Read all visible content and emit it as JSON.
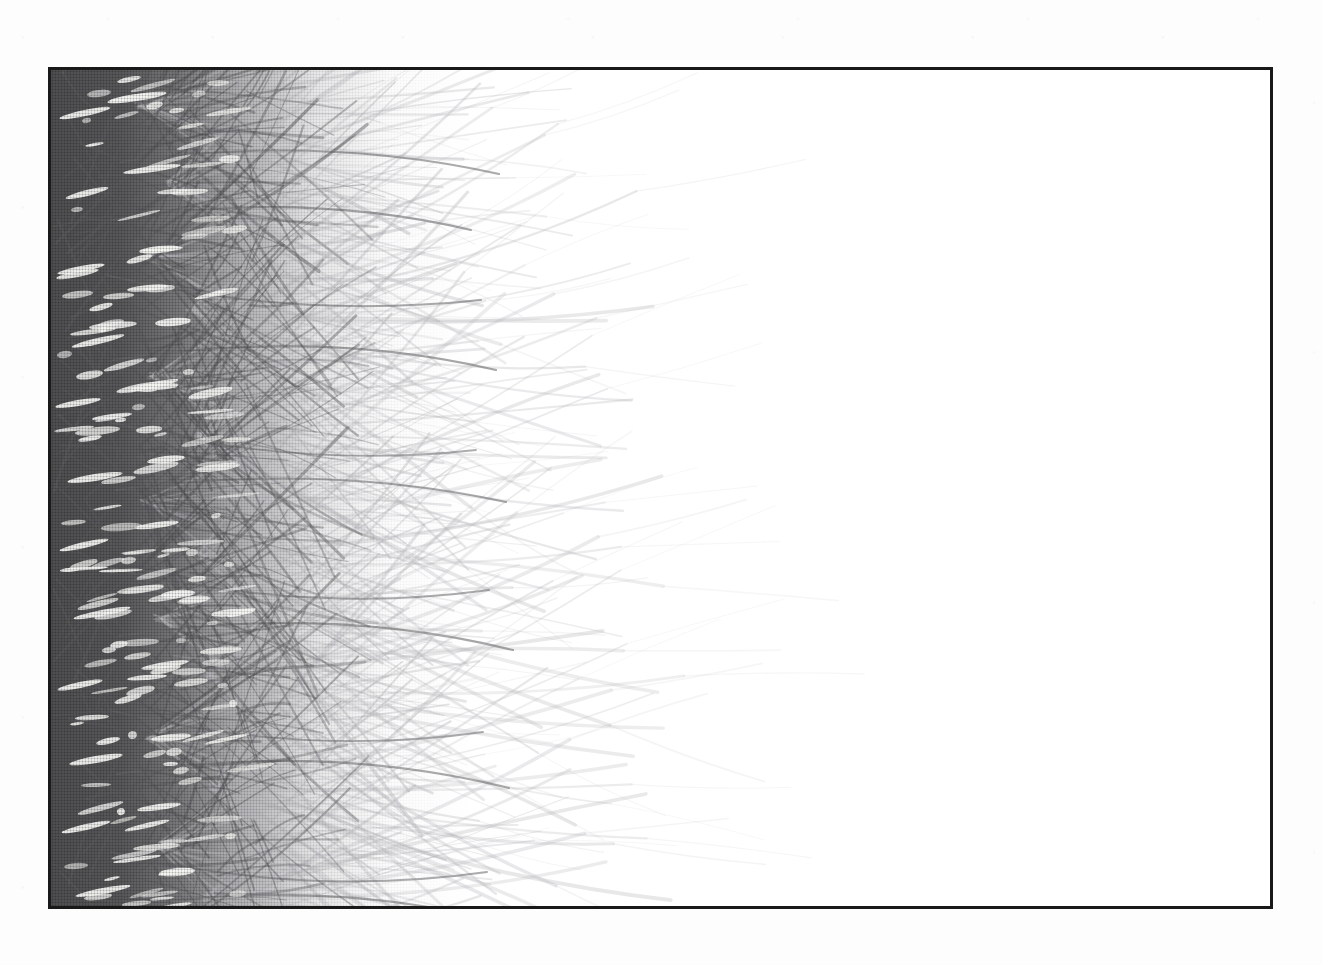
{
  "document": {
    "kind": "scanned-photographic-plate",
    "media": "halftone black-and-white photographic print",
    "subject": "palm fronds / grass blades radiating from rosettes along the left edge",
    "orientation": "landscape",
    "caption": "",
    "title": "",
    "page_number": "",
    "visible_text": []
  },
  "canvas": {
    "width": 1322,
    "height": 965,
    "paper_color": "#fdfdfd",
    "speckle_color": "#96969f"
  },
  "plate": {
    "x": 48,
    "y": 67,
    "width": 1225,
    "height": 842,
    "border_width": 3,
    "border_color": "#191919",
    "image_background": "#ffffff"
  },
  "tones": {
    "deep_shadow": "#48484a",
    "mid_shadow": "#5c5c5f",
    "blade_stroke": "#6a6a6d",
    "faint_blade_stroke": "#b8b8bc",
    "highlight": "#f4f4f2",
    "paper_white": "#ffffff"
  },
  "composition": {
    "dense_mass_left": 0,
    "dense_mass_width": 430,
    "fade_end_x": 430,
    "blade_tip_max_x": 470,
    "halftone_dot_pitch_px": 3
  },
  "rosettes": [
    {
      "cx": 88,
      "cy": 36,
      "blades": 16,
      "spread": 88,
      "reach": 300,
      "weight": 2.6
    },
    {
      "cx": 120,
      "cy": 112,
      "blades": 18,
      "spread": 95,
      "reach": 345,
      "weight": 2.5
    },
    {
      "cx": 96,
      "cy": 186,
      "blades": 15,
      "spread": 82,
      "reach": 280,
      "weight": 2.4
    },
    {
      "cx": 140,
      "cy": 238,
      "blades": 20,
      "spread": 100,
      "reach": 395,
      "weight": 2.7
    },
    {
      "cx": 102,
      "cy": 306,
      "blades": 16,
      "spread": 86,
      "reach": 305,
      "weight": 2.3
    },
    {
      "cx": 148,
      "cy": 366,
      "blades": 19,
      "spread": 98,
      "reach": 380,
      "weight": 2.6
    },
    {
      "cx": 92,
      "cy": 432,
      "blades": 15,
      "spread": 80,
      "reach": 288,
      "weight": 2.2
    },
    {
      "cx": 152,
      "cy": 486,
      "blades": 21,
      "spread": 104,
      "reach": 410,
      "weight": 2.8
    },
    {
      "cx": 106,
      "cy": 548,
      "blades": 16,
      "spread": 88,
      "reach": 312,
      "weight": 2.4
    },
    {
      "cx": 158,
      "cy": 604,
      "blades": 20,
      "spread": 100,
      "reach": 400,
      "weight": 2.7
    },
    {
      "cx": 98,
      "cy": 666,
      "blades": 15,
      "spread": 84,
      "reach": 295,
      "weight": 2.3
    },
    {
      "cx": 162,
      "cy": 716,
      "blades": 21,
      "spread": 102,
      "reach": 415,
      "weight": 2.8
    },
    {
      "cx": 110,
      "cy": 776,
      "blades": 17,
      "spread": 90,
      "reach": 320,
      "weight": 2.4
    },
    {
      "cx": 156,
      "cy": 826,
      "blades": 20,
      "spread": 100,
      "reach": 392,
      "weight": 2.7
    },
    {
      "cx": 96,
      "cy": 880,
      "blades": 16,
      "spread": 86,
      "reach": 300,
      "weight": 2.3
    }
  ],
  "long_blades": [
    {
      "x1": 60,
      "y1": 150,
      "cx": 250,
      "cy": 120,
      "x2": 420,
      "y2": 160,
      "w": 2.1,
      "o": 0.62
    },
    {
      "x1": 55,
      "y1": 205,
      "cx": 240,
      "cy": 250,
      "x2": 430,
      "y2": 230,
      "w": 2.0,
      "o": 0.58
    },
    {
      "x1": 62,
      "y1": 290,
      "cx": 265,
      "cy": 258,
      "x2": 445,
      "y2": 300,
      "w": 2.2,
      "o": 0.6
    },
    {
      "x1": 58,
      "y1": 352,
      "cx": 245,
      "cy": 400,
      "x2": 425,
      "y2": 380,
      "w": 1.9,
      "o": 0.55
    },
    {
      "x1": 65,
      "y1": 420,
      "cx": 270,
      "cy": 392,
      "x2": 455,
      "y2": 432,
      "w": 2.1,
      "o": 0.58
    },
    {
      "x1": 60,
      "y1": 498,
      "cx": 255,
      "cy": 545,
      "x2": 438,
      "y2": 520,
      "w": 2.0,
      "o": 0.56
    },
    {
      "x1": 68,
      "y1": 566,
      "cx": 275,
      "cy": 534,
      "x2": 462,
      "y2": 580,
      "w": 2.2,
      "o": 0.6
    },
    {
      "x1": 58,
      "y1": 640,
      "cx": 250,
      "cy": 688,
      "x2": 432,
      "y2": 662,
      "w": 1.9,
      "o": 0.54
    },
    {
      "x1": 66,
      "y1": 704,
      "cx": 272,
      "cy": 672,
      "x2": 458,
      "y2": 718,
      "w": 2.1,
      "o": 0.58
    },
    {
      "x1": 60,
      "y1": 782,
      "cx": 252,
      "cy": 828,
      "x2": 436,
      "y2": 802,
      "w": 2.0,
      "o": 0.56
    },
    {
      "x1": 70,
      "y1": 92,
      "cx": 268,
      "cy": 64,
      "x2": 448,
      "y2": 104,
      "w": 2.1,
      "o": 0.57
    },
    {
      "x1": 64,
      "y1": 838,
      "cx": 266,
      "cy": 806,
      "x2": 450,
      "y2": 852,
      "w": 2.1,
      "o": 0.57
    }
  ],
  "slivers": [
    {
      "x": 8,
      "y": 40,
      "w": 52,
      "h": 6,
      "r": -12
    },
    {
      "x": 56,
      "y": 24,
      "w": 60,
      "h": 7,
      "r": -9
    },
    {
      "x": 14,
      "y": 120,
      "w": 44,
      "h": 6,
      "r": -14
    },
    {
      "x": 72,
      "y": 96,
      "w": 58,
      "h": 6,
      "r": -8
    },
    {
      "x": 6,
      "y": 196,
      "w": 48,
      "h": 6,
      "r": -11
    },
    {
      "x": 88,
      "y": 176,
      "w": 40,
      "h": 7,
      "r": -6
    },
    {
      "x": 20,
      "y": 268,
      "w": 54,
      "h": 6,
      "r": -13
    },
    {
      "x": 104,
      "y": 248,
      "w": 36,
      "h": 8,
      "r": -5
    },
    {
      "x": 4,
      "y": 330,
      "w": 46,
      "h": 6,
      "r": -10
    },
    {
      "x": 78,
      "y": 312,
      "w": 50,
      "h": 6,
      "r": -12
    },
    {
      "x": 16,
      "y": 404,
      "w": 56,
      "h": 7,
      "r": -9
    },
    {
      "x": 96,
      "y": 386,
      "w": 38,
      "h": 7,
      "r": -7
    },
    {
      "x": 8,
      "y": 472,
      "w": 50,
      "h": 6,
      "r": -13
    },
    {
      "x": 84,
      "y": 452,
      "w": 44,
      "h": 6,
      "r": -8
    },
    {
      "x": 22,
      "y": 540,
      "w": 58,
      "h": 6,
      "r": -11
    },
    {
      "x": 110,
      "y": 520,
      "w": 34,
      "h": 8,
      "r": -5
    },
    {
      "x": 6,
      "y": 612,
      "w": 46,
      "h": 6,
      "r": -12
    },
    {
      "x": 90,
      "y": 592,
      "w": 48,
      "h": 6,
      "r": -9
    },
    {
      "x": 18,
      "y": 686,
      "w": 54,
      "h": 7,
      "r": -10
    },
    {
      "x": 100,
      "y": 664,
      "w": 40,
      "h": 7,
      "r": -6
    },
    {
      "x": 10,
      "y": 754,
      "w": 50,
      "h": 6,
      "r": -13
    },
    {
      "x": 86,
      "y": 734,
      "w": 44,
      "h": 6,
      "r": -8
    },
    {
      "x": 24,
      "y": 818,
      "w": 56,
      "h": 6,
      "r": -11
    },
    {
      "x": 108,
      "y": 798,
      "w": 36,
      "h": 8,
      "r": -5
    },
    {
      "x": 4,
      "y": 862,
      "w": 48,
      "h": 6,
      "r": -12
    },
    {
      "x": 92,
      "y": 842,
      "w": 42,
      "h": 6,
      "r": -9
    }
  ],
  "chart_data": null
}
